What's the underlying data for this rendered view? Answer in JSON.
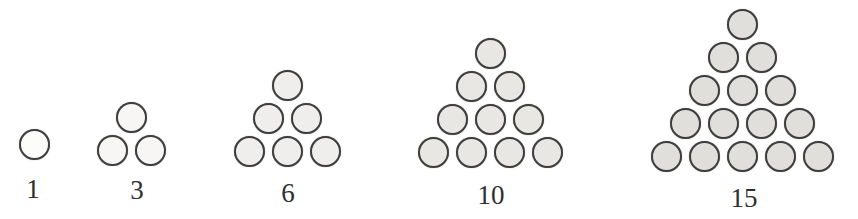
{
  "figure": {
    "background": "#ffffff",
    "circle_stroke": "#3e3e3e",
    "label_color": "#2f2f2f",
    "groups": [
      {
        "label": "1",
        "value": 1,
        "rows": 1,
        "fill": "#fcfcfb"
      },
      {
        "label": "3",
        "value": 3,
        "rows": 2,
        "fill": "#f7f6f4"
      },
      {
        "label": "6",
        "value": 6,
        "rows": 3,
        "fill": "#efeeec"
      },
      {
        "label": "10",
        "value": 10,
        "rows": 4,
        "fill": "#e8e7e4"
      },
      {
        "label": "15",
        "value": 15,
        "rows": 5,
        "fill": "#e0dfdc"
      }
    ]
  }
}
